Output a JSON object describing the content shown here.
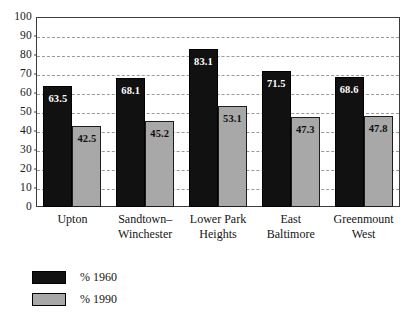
{
  "chart_data": {
    "type": "bar",
    "title": "",
    "subtitle": "",
    "xlabel": "",
    "ylabel": "",
    "ylim": [
      0,
      100
    ],
    "yticks": [
      0,
      10,
      20,
      30,
      40,
      50,
      60,
      70,
      80,
      90,
      100
    ],
    "grid": true,
    "legend_position": "bottom-left",
    "categories": [
      "Upton",
      "Sandtown–Winchester",
      "Lower Park Heights",
      "East Baltimore",
      "Greenmount West"
    ],
    "category_lines": [
      [
        "Upton"
      ],
      [
        "Sandtown–",
        "Winchester"
      ],
      [
        "Lower Park",
        "Heights"
      ],
      [
        "East",
        "Baltimore"
      ],
      [
        "Greenmount",
        "West"
      ]
    ],
    "series": [
      {
        "name": "% 1960",
        "color": "#111111",
        "values": [
          63.5,
          68.1,
          83.1,
          71.5,
          68.6
        ],
        "labels": [
          "63.5",
          "68.1",
          "83.1",
          "71.5",
          "68.6"
        ]
      },
      {
        "name": "% 1990",
        "color": "#a8a8a8",
        "values": [
          42.5,
          45.2,
          53.1,
          47.3,
          47.8
        ],
        "labels": [
          "42.5",
          "45.2",
          "53.1",
          "47.3",
          "47.8"
        ]
      }
    ],
    "ytick_labels": [
      "100",
      "90",
      "80",
      "70",
      "60",
      "50",
      "40",
      "30",
      "20",
      "10",
      "0"
    ]
  },
  "legend": {
    "items": [
      {
        "label": "% 1960",
        "swatch": "black-swatch"
      },
      {
        "label": "% 1990",
        "swatch": "gray-swatch"
      }
    ]
  },
  "colors": {
    "series_1960": "#111111",
    "series_1990": "#a8a8a8",
    "frame": "#3c3c3c",
    "gridline": "#9a9a9a",
    "background": "#ffffff"
  }
}
